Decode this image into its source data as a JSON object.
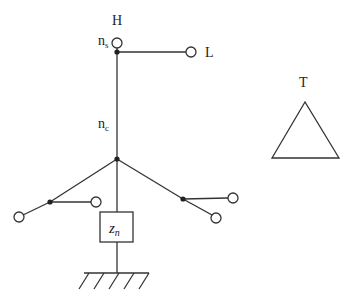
{
  "diagram": {
    "type": "transformer-winding-schematic",
    "labels": {
      "high_voltage": "H",
      "low_voltage": "L",
      "tertiary": "T",
      "series_winding": "n",
      "series_sub": "s",
      "common_winding": "n",
      "common_sub": "c",
      "neutral_impedance": "z",
      "neutral_sub": "n"
    },
    "colors": {
      "line": "#333333",
      "node": "#222222",
      "terminal_fill": "#ffffff"
    }
  }
}
